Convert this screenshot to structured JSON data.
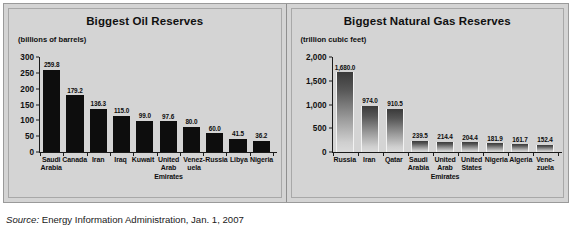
{
  "source": {
    "label": "Source:",
    "text": "Energy Information Administration, Jan. 1, 2007"
  },
  "chart_data": [
    {
      "type": "bar",
      "title": "Biggest Oil Reserves",
      "subtitle": "(billions of barrels)",
      "xlabel": "",
      "ylabel": "billions of barrels",
      "ylim": [
        0,
        300
      ],
      "yticks": [
        "300",
        "250",
        "200",
        "150",
        "100",
        "50",
        "0"
      ],
      "ytick_values": [
        300,
        250,
        200,
        150,
        100,
        50,
        0
      ],
      "grid": false,
      "legend": "none",
      "bar_style": "solid-black",
      "categories": [
        "Saudi Arabia",
        "Canada",
        "Iran",
        "Iraq",
        "Kuwait",
        "United Arab Emirates",
        "Venezuela",
        "Russia",
        "Libya",
        "Nigeria"
      ],
      "category_lines": [
        [
          "Saudi",
          "Arabia"
        ],
        [
          "Canada"
        ],
        [
          "Iran"
        ],
        [
          "Iraq"
        ],
        [
          "Kuwait"
        ],
        [
          "United",
          "Arab",
          "Emirates"
        ],
        [
          "Venez-",
          "uela"
        ],
        [
          "Russia"
        ],
        [
          "Libya"
        ],
        [
          "Nigeria"
        ]
      ],
      "values": [
        259.8,
        179.2,
        136.3,
        115.0,
        99.0,
        97.6,
        80.0,
        60.0,
        41.5,
        36.2
      ],
      "value_labels": [
        "259.8",
        "179.2",
        "136.3",
        "115.0",
        "99.0",
        "97.6",
        "80.0",
        "60.0",
        "41.5",
        "36.2"
      ]
    },
    {
      "type": "bar",
      "title": "Biggest Natural Gas Reserves",
      "subtitle": "(trillion cubic feet)",
      "xlabel": "",
      "ylabel": "trillion cubic feet",
      "ylim": [
        0,
        2000
      ],
      "yticks": [
        "2,000",
        "1,500",
        "1,000",
        "500",
        "0"
      ],
      "ytick_values": [
        2000,
        1500,
        1000,
        500,
        0
      ],
      "grid": false,
      "legend": "none",
      "bar_style": "gradient",
      "categories": [
        "Russia",
        "Iran",
        "Qatar",
        "Saudi Arabia",
        "United Arab Emirates",
        "United States",
        "Nigeria",
        "Algeria",
        "Venezuela"
      ],
      "category_lines": [
        [
          "Russia"
        ],
        [
          "Iran"
        ],
        [
          "Qatar"
        ],
        [
          "Saudi",
          "Arabia"
        ],
        [
          "United",
          "Arab",
          "Emirates"
        ],
        [
          "United",
          "States"
        ],
        [
          "Nigeria"
        ],
        [
          "Algeria"
        ],
        [
          "Vene-",
          "zuela"
        ]
      ],
      "values": [
        1680.0,
        974.0,
        910.5,
        239.5,
        214.4,
        204.4,
        181.9,
        161.7,
        152.4
      ],
      "value_labels": [
        "1,680.0",
        "974.0",
        "910.5",
        "239.5",
        "214.4",
        "204.4",
        "181.9",
        "161.7",
        "152.4"
      ]
    }
  ]
}
